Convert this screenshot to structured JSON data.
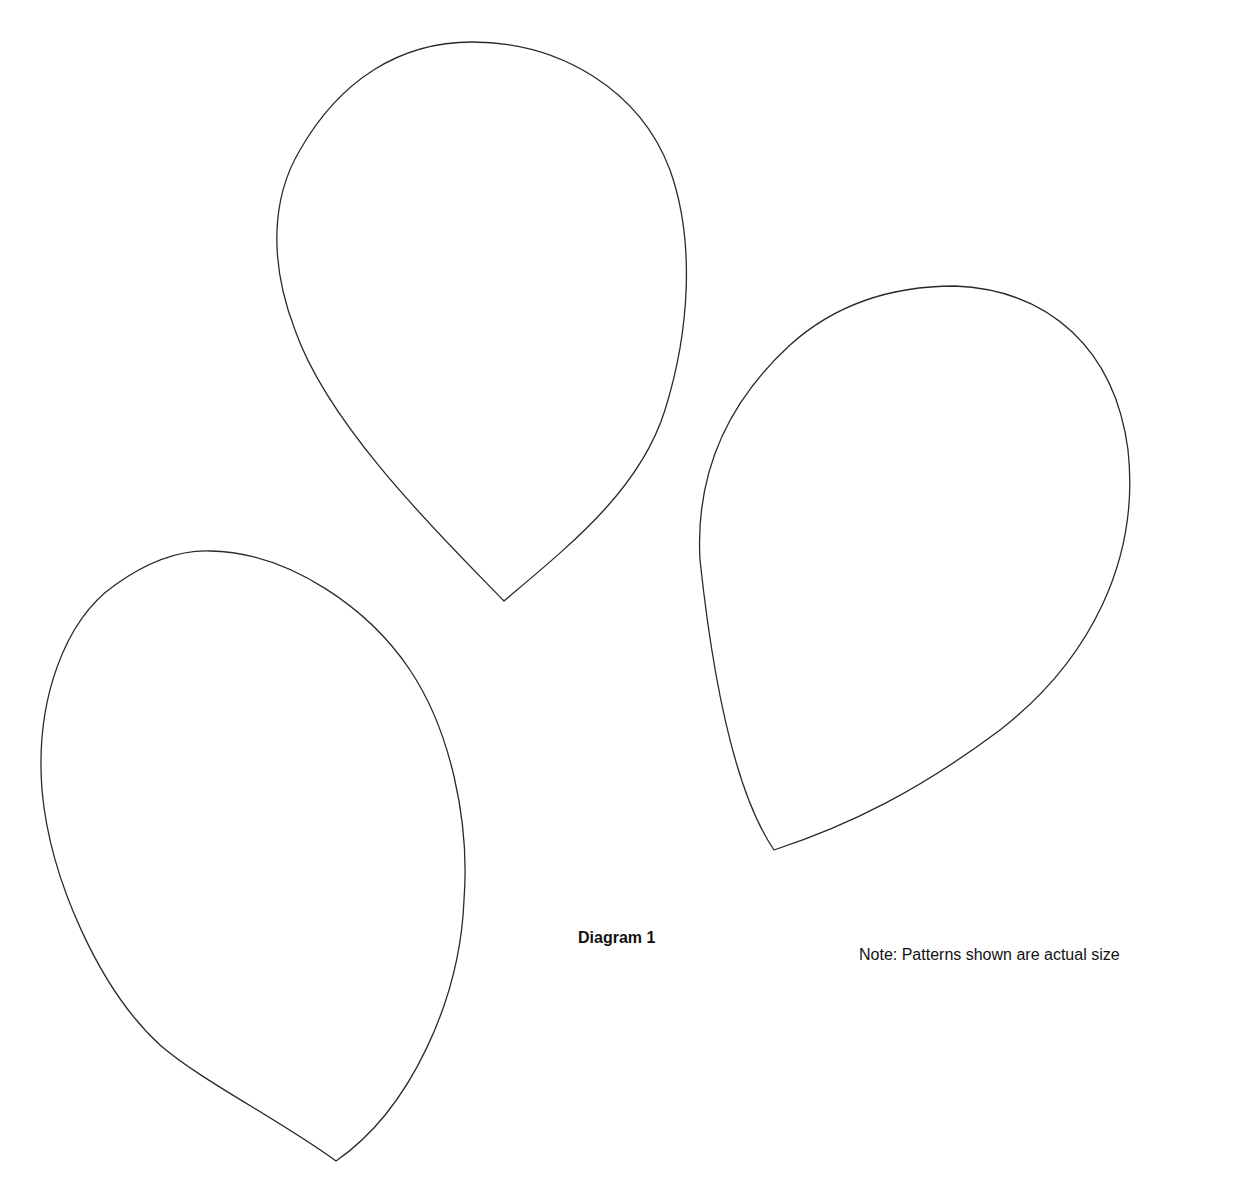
{
  "diagram": {
    "title": "Diagram 1",
    "note": "Note: Patterns shown are actual size",
    "shapes": [
      {
        "name": "petal-top",
        "description": "teardrop petal pattern, tip pointing down"
      },
      {
        "name": "petal-right",
        "description": "teardrop petal pattern, tip pointing down-left"
      },
      {
        "name": "petal-bottom-left",
        "description": "teardrop petal pattern, tip pointing down-right"
      }
    ],
    "stroke_color": "#2a2a2a",
    "background_color": "#ffffff"
  }
}
